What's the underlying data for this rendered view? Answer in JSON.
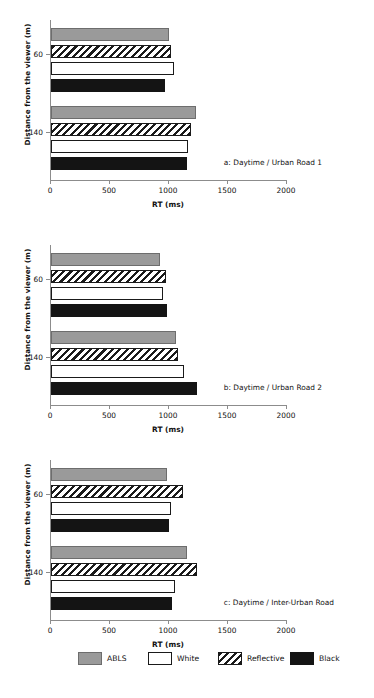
{
  "chart_data": {
    "type": "bar",
    "title": "",
    "orientation": "horizontal",
    "xlabel": "RT (ms)",
    "ylabel": "Distance from the viewer (m)",
    "xlim": [
      0,
      2000
    ],
    "xticks": [
      0,
      500,
      1000,
      1500,
      2000
    ],
    "xtick_labels": [
      "0",
      "500",
      "1000",
      "1500",
      "2000"
    ],
    "categories": [
      "60",
      "140"
    ],
    "grid": false,
    "legend_position": "bottom",
    "legend": [
      "ABLS",
      "White",
      "Reflective",
      "Black"
    ],
    "series_colors": {
      "ABLS": "#9a9a9a",
      "White": "#ffffff",
      "Reflective": "#1a1a1a",
      "Black": "#141414"
    },
    "panels": [
      {
        "caption": "a: Daytime / Urban Road 1",
        "series": [
          {
            "name": "ABLS",
            "values": [
              1000,
              1230
            ]
          },
          {
            "name": "Reflective",
            "values": [
              1015,
              1190
            ]
          },
          {
            "name": "White",
            "values": [
              1040,
              1165
            ]
          },
          {
            "name": "Black",
            "values": [
              970,
              1150
            ]
          }
        ]
      },
      {
        "caption": "b: Daytime / Urban Road 2",
        "series": [
          {
            "name": "ABLS",
            "values": [
              925,
              1060
            ]
          },
          {
            "name": "Reflective",
            "values": [
              975,
              1080
            ]
          },
          {
            "name": "White",
            "values": [
              950,
              1130
            ]
          },
          {
            "name": "Black",
            "values": [
              985,
              1240
            ]
          }
        ]
      },
      {
        "caption": "c: Daytime / Inter-Urban Road",
        "series": [
          {
            "name": "ABLS",
            "values": [
              980,
              1150
            ]
          },
          {
            "name": "Reflective",
            "values": [
              1120,
              1240
            ]
          },
          {
            "name": "White",
            "values": [
              1015,
              1050
            ]
          },
          {
            "name": "Black",
            "values": [
              1000,
              1025
            ]
          }
        ]
      }
    ]
  }
}
